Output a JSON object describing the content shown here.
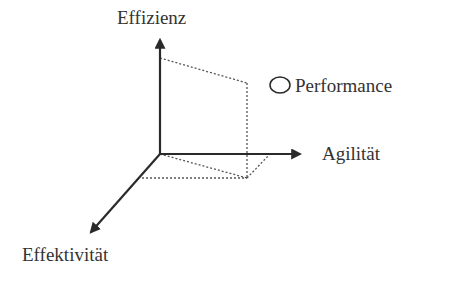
{
  "diagram": {
    "axes": {
      "y": {
        "label": "Effizienz"
      },
      "x": {
        "label": "Agilität"
      },
      "z": {
        "label": "Effektivität"
      }
    },
    "legend": {
      "marker": "circle",
      "label": "Performance"
    },
    "colors": {
      "axis": "#2a2a2a",
      "dotted": "#555555",
      "text": "#333333"
    }
  }
}
